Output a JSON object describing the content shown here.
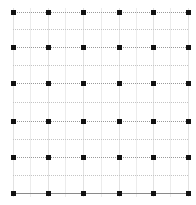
{
  "diagram": {
    "type": "dot-lattice",
    "rows": 6,
    "cols": 6,
    "col_x": [
      13,
      48,
      83,
      119,
      153,
      188
    ],
    "row_y": [
      12,
      47,
      83,
      121,
      157,
      193
    ],
    "mid_col_x": [
      30,
      65,
      101,
      136,
      170
    ],
    "mid_row_y": [
      29,
      65,
      102,
      139,
      175
    ],
    "colors": {
      "dot": "#111111",
      "major_line": "#9a9a9a",
      "minor_line": "#c4c4c4",
      "vertical_line": "#e2e2e2",
      "baseline": "#8a8a8a",
      "background": "#ffffff"
    }
  }
}
